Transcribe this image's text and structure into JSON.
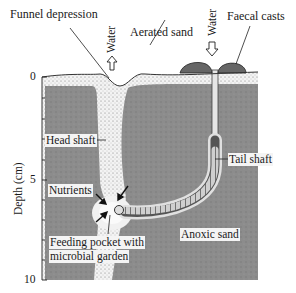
{
  "diagram": {
    "type": "cross-section of lugworm burrow in sediment",
    "labels": {
      "funnel": "Funnel depression",
      "aerated": "Aerated sand",
      "water_left": "Water",
      "water_right": "Water",
      "faecal": "Faecal casts",
      "head_shaft": "Head shaft",
      "tail_shaft": "Tail shaft",
      "nutrients": "Nutrients",
      "feeding_line1": "Feeding pocket with",
      "feeding_line2": "microbial garden",
      "anoxic": "Anoxic sand"
    },
    "axis": {
      "label": "Depth (cm)",
      "ticks": [
        "0",
        "5",
        "10"
      ]
    },
    "colors": {
      "anoxic_sand": "#8a8a8a",
      "aerated_sand": "#eeeeee",
      "outline": "#222222"
    }
  }
}
